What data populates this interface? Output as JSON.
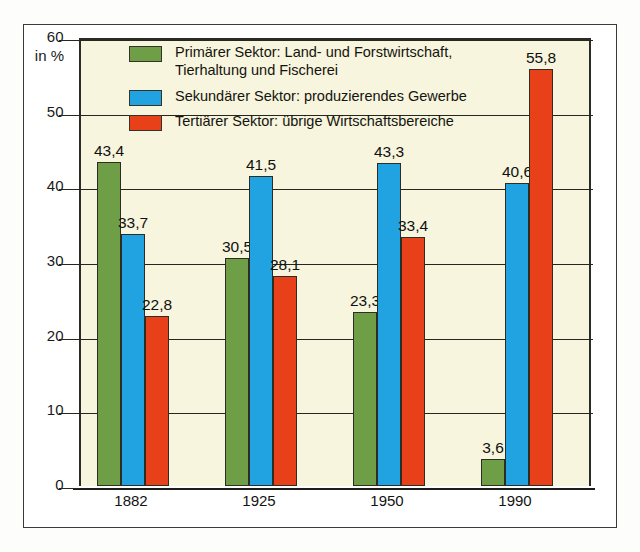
{
  "chart_data": {
    "type": "bar",
    "title": "",
    "subtitle": "",
    "xlabel": "",
    "ylabel": "in %",
    "ylim": [
      0,
      60
    ],
    "yticks": [
      0,
      10,
      20,
      30,
      40,
      50,
      60
    ],
    "ytick_labels": [
      "0",
      "10",
      "20",
      "30",
      "40",
      "50",
      "60"
    ],
    "grid": true,
    "legend_position": "inside-top-left",
    "categories": [
      "1882",
      "1925",
      "1950",
      "1990"
    ],
    "series": [
      {
        "name": "Primärer Sektor: Land- und Forstwirtschaft,\nTierhaltung und Fischerei",
        "short_name": "Primärer Sektor",
        "color": "#6e9e46",
        "values": [
          43.4,
          30.5,
          23.3,
          3.6
        ],
        "value_labels": [
          "43,4",
          "30,5",
          "23,3",
          "3,6"
        ]
      },
      {
        "name": "Sekundärer Sektor: produzierendes Gewerbe",
        "short_name": "Sekundärer Sektor",
        "color": "#21a3e1",
        "values": [
          33.7,
          41.5,
          43.3,
          40.6
        ],
        "value_labels": [
          "33,7",
          "41,5",
          "43,3",
          "40,6"
        ]
      },
      {
        "name": "Tertiärer Sektor: übrige Wirtschaftsbereiche",
        "short_name": "Tertiärer Sektor",
        "color": "#e8411a",
        "values": [
          22.8,
          28.1,
          33.4,
          55.8
        ],
        "value_labels": [
          "22,8",
          "28,1",
          "33,4",
          "55,8"
        ]
      }
    ]
  },
  "axis": {
    "unit_label": "in %",
    "tick_60": "60",
    "tick_50": "50",
    "tick_40": "40",
    "tick_30": "30",
    "tick_20": "20",
    "tick_10": "10",
    "tick_0": "0"
  },
  "legend": {
    "items": [
      {
        "label": "Primärer Sektor: Land- und Forstwirtschaft,\nTierhaltung und Fischerei",
        "color": "#6e9e46"
      },
      {
        "label": "Sekundärer Sektor: produzierendes Gewerbe",
        "color": "#21a3e1"
      },
      {
        "label": "Tertiärer Sektor: übrige Wirtschaftsbereiche",
        "color": "#e8411a"
      }
    ]
  },
  "xaxis": {
    "labels": [
      "1882",
      "1925",
      "1950",
      "1990"
    ]
  },
  "colors": {
    "primary_sector": "#6e9e46",
    "secondary_sector": "#21a3e1",
    "tertiary_sector": "#e8411a",
    "plot_background": "#f7f5dd",
    "page_background": "#ffffff",
    "axis": "#26261f"
  }
}
